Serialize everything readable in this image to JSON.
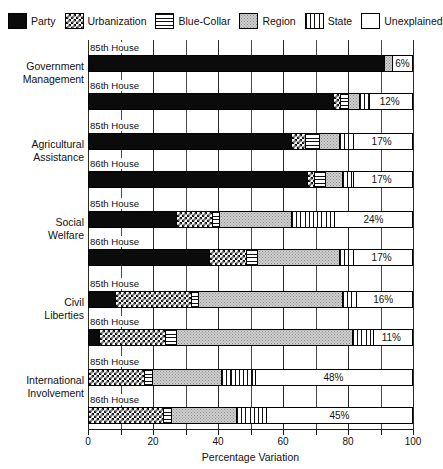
{
  "legend": {
    "items": [
      {
        "label": "Party",
        "key": "party",
        "swatch": "solid-black-swatch"
      },
      {
        "label": "Urbanization",
        "key": "urbanization",
        "swatch": "checkered-swatch"
      },
      {
        "label": "Blue-Collar",
        "key": "blue_collar",
        "swatch": "horizontal-lines-swatch"
      },
      {
        "label": "Region",
        "key": "region",
        "swatch": "gray-stipple-swatch"
      },
      {
        "label": "State",
        "key": "state",
        "swatch": "vertical-lines-swatch"
      },
      {
        "label": "Unexplained",
        "key": "unexplained",
        "swatch": "white-swatch"
      }
    ]
  },
  "chart_data": {
    "type": "bar",
    "orientation": "horizontal",
    "stacked": true,
    "title": "",
    "xlabel": "Percentage Variation",
    "ylabel": "",
    "xlim": [
      0,
      100
    ],
    "xticks": [
      0,
      10,
      20,
      30,
      40,
      50,
      60,
      70,
      80,
      90,
      100
    ],
    "xtick_labels": [
      "0",
      "",
      "20",
      "",
      "40",
      "",
      "60",
      "",
      "80",
      "",
      "100"
    ],
    "grid": true,
    "legend_position": "top",
    "series_names": [
      "Party",
      "Urbanization",
      "Blue-Collar",
      "Region",
      "State",
      "Unexplained"
    ],
    "categories": [
      "Government Management",
      "Agricultural Assistance",
      "Social Welfare",
      "Civil Liberties",
      "International Involvement"
    ],
    "subgroups": [
      "85th House",
      "86th House"
    ],
    "groups": [
      {
        "category": "Government Management",
        "label_lines": [
          "Government",
          "Management"
        ],
        "bars": [
          {
            "subgroup": "85th House",
            "values": {
              "party": 92,
              "urbanization": 0,
              "blue_collar": 0,
              "region": 2,
              "state": 0,
              "unexplained": 6
            },
            "unexplained_label": "6%"
          },
          {
            "subgroup": "86th House",
            "values": {
              "party": 75,
              "urbanization": 2,
              "blue_collar": 2,
              "region": 3,
              "state": 3,
              "unexplained": 12
            },
            "unexplained_label": "12%"
          }
        ]
      },
      {
        "category": "Agricultural Assistance",
        "label_lines": [
          "Agricultural",
          "Assistance"
        ],
        "bars": [
          {
            "subgroup": "85th House",
            "values": {
              "party": 62,
              "urbanization": 4,
              "blue_collar": 4,
              "region": 6,
              "state": 4,
              "unexplained": 17
            },
            "unexplained_label": "17%"
          },
          {
            "subgroup": "86th House",
            "values": {
              "party": 67,
              "urbanization": 2,
              "blue_collar": 3,
              "region": 5,
              "state": 3,
              "unexplained": 17
            },
            "unexplained_label": "17%"
          }
        ]
      },
      {
        "category": "Social Welfare",
        "label_lines": [
          "Social",
          "Welfare"
        ],
        "bars": [
          {
            "subgroup": "85th House",
            "values": {
              "party": 27,
              "urbanization": 11,
              "blue_collar": 2,
              "region": 22,
              "state": 13,
              "unexplained": 24
            },
            "unexplained_label": "24%"
          },
          {
            "subgroup": "86th House",
            "values": {
              "party": 37,
              "urbanization": 11,
              "blue_collar": 3,
              "region": 25,
              "state": 4,
              "unexplained": 17
            },
            "unexplained_label": "17%"
          }
        ]
      },
      {
        "category": "Civil Liberties",
        "label_lines": [
          "Civil",
          "Liberties"
        ],
        "bars": [
          {
            "subgroup": "85th House",
            "values": {
              "party": 8,
              "urbanization": 23,
              "blue_collar": 2,
              "region": 44,
              "state": 4,
              "unexplained": 16
            },
            "unexplained_label": "16%"
          },
          {
            "subgroup": "86th House",
            "values": {
              "party": 3,
              "urbanization": 20,
              "blue_collar": 3,
              "region": 54,
              "state": 6,
              "unexplained": 11
            },
            "unexplained_label": "11%"
          }
        ]
      },
      {
        "category": "International Involvement",
        "label_lines": [
          "International",
          "Involvement"
        ],
        "bars": [
          {
            "subgroup": "85th House",
            "values": {
              "party": 0,
              "urbanization": 17,
              "blue_collar": 2,
              "region": 21,
              "state": 10,
              "unexplained": 48
            },
            "unexplained_label": "48%"
          },
          {
            "subgroup": "86th House",
            "values": {
              "party": 0,
              "urbanization": 23,
              "blue_collar": 2,
              "region": 20,
              "state": 9,
              "unexplained": 45
            },
            "unexplained_label": "45%"
          }
        ]
      }
    ]
  }
}
